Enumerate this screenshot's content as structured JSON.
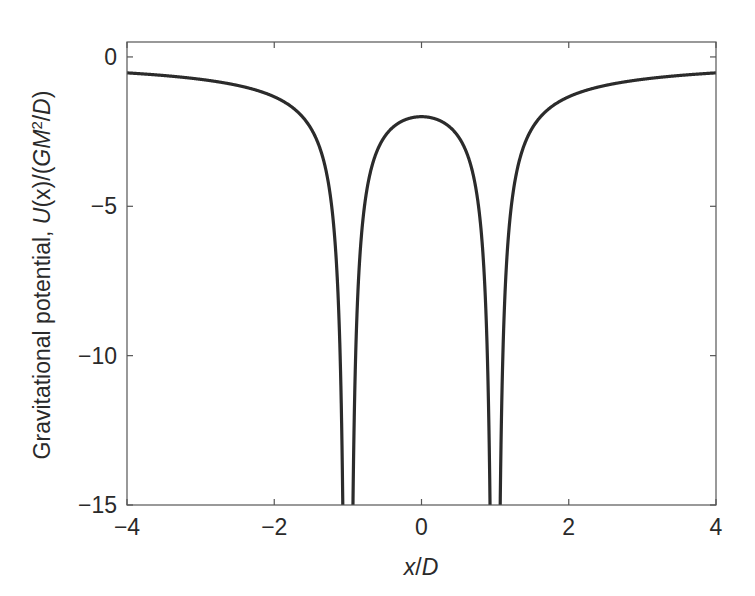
{
  "chart_data": {
    "type": "line",
    "title": "",
    "xlabel": "x/D",
    "ylabel": "Gravitational potential, U(x)/(GM²/D)",
    "ylabel_parts": {
      "prefix": "Gravitational potential, ",
      "func": "U",
      "arg": "(x)/(",
      "gm": "GM",
      "sup": "2",
      "tail": "/",
      "d": "D",
      "close": ")"
    },
    "xlabel_parts": {
      "x": "x",
      "slash": "/",
      "d": "D"
    },
    "xlim": [
      -4,
      4
    ],
    "ylim": [
      -15,
      0.5
    ],
    "xticks": [
      -4,
      -2,
      0,
      2,
      4
    ],
    "xtick_labels": [
      "−4",
      "−2",
      "0",
      "2",
      "4"
    ],
    "yticks": [
      0,
      -5,
      -10,
      -15
    ],
    "ytick_labels": [
      "0",
      "−5",
      "−10",
      "−15"
    ],
    "grid": false,
    "legend": null,
    "line_color": "#2b2b2b",
    "series": [
      {
        "name": "U(x) = -1/|x-1| - 1/|x+1|",
        "x": [
          -4,
          -3,
          -2,
          -1.5,
          -1.2,
          -1.1,
          -1.07,
          -0.93,
          -0.9,
          -0.8,
          -0.5,
          0,
          0.5,
          0.8,
          0.9,
          0.93,
          1.07,
          1.1,
          1.2,
          1.5,
          2,
          3,
          4
        ],
        "y": [
          -0.533,
          -0.75,
          -1.333,
          -2.4,
          -5.455,
          -10.476,
          -14.77,
          -14.81,
          -10.526,
          -5.556,
          -2.667,
          -2.0,
          -2.667,
          -5.556,
          -10.526,
          -14.81,
          -14.77,
          -10.476,
          -5.455,
          -2.4,
          -1.333,
          -0.75,
          -0.533
        ]
      }
    ],
    "singularities": [
      -1,
      1
    ]
  }
}
